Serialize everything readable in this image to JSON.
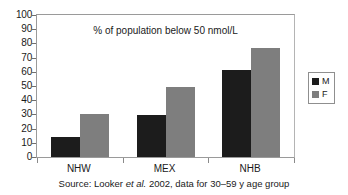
{
  "chart_data": {
    "type": "bar",
    "title": "% of population below 50 nmol/L",
    "xlabel": "",
    "ylabel": "",
    "ylim": [
      0,
      100
    ],
    "ytick_step": 10,
    "grid": false,
    "legend_position": "right",
    "categories": [
      "NHW",
      "MEX",
      "NHB"
    ],
    "series": [
      {
        "name": "M",
        "color": "#1c1c1c",
        "values": [
          14,
          29.5,
          61
        ]
      },
      {
        "name": "F",
        "color": "#7e7e7e",
        "values": [
          30.5,
          49.5,
          77
        ]
      }
    ],
    "ytick_labels": [
      "0",
      "10",
      "20",
      "30",
      "40",
      "50",
      "60",
      "70",
      "80",
      "90",
      "100"
    ],
    "caption": {
      "prefix": "Source: Looker ",
      "italic": "et al.",
      "suffix": " 2002, data for 30–59 y age group"
    }
  },
  "legend": {
    "items": [
      {
        "label": "M"
      },
      {
        "label": "F"
      }
    ]
  }
}
